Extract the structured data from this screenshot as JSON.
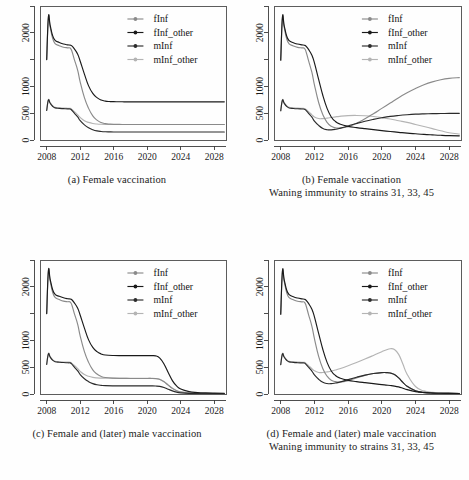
{
  "figure": {
    "panel_labels": [
      "(a)",
      "(b)",
      "(c)",
      "(d)"
    ]
  },
  "legend": {
    "position": "top-right",
    "entries": [
      {
        "label": "fInf",
        "color": "#8a8a8a"
      },
      {
        "label": "fInf_other",
        "color": "#1a1a1a"
      },
      {
        "label": "mInf",
        "color": "#2b2b2b"
      },
      {
        "label": "mInf_other",
        "color": "#b4b4b4"
      }
    ]
  },
  "axis": {
    "x_ticks": [
      2008,
      2012,
      2016,
      2020,
      2024,
      2028
    ],
    "x_tick_labels": [
      "2008",
      "2012",
      "2016",
      "2020",
      "2024",
      "2028"
    ],
    "y_ticks": [
      0,
      500,
      1000,
      1500,
      2000,
      2500
    ],
    "y_tick_labels": [
      "0",
      "500",
      "1000",
      "",
      "2000",
      ""
    ],
    "xlim": [
      2007.2,
      2029.4
    ],
    "ylim": [
      0,
      2500
    ]
  },
  "captions": {
    "a": [
      "(a) Female vaccination"
    ],
    "b": [
      "(b) Female vaccination",
      "Waning immunity to strains 31, 33, 45"
    ],
    "c": [
      "(c) Female and (later) male vaccination"
    ],
    "d": [
      "(d) Female and (later) male vaccination",
      "Waning immunity to strains 31, 33, 45"
    ]
  },
  "chart_data": [
    {
      "id": "a",
      "type": "line",
      "title": "(a) Female vaccination",
      "xlabel": "",
      "ylabel": "",
      "xlim": [
        2007.2,
        2029.4
      ],
      "ylim": [
        0,
        2500
      ],
      "grid": false,
      "legend_position": "top-right",
      "x": [
        2008.0,
        2008.2,
        2008.4,
        2008.7,
        2009.0,
        2009.5,
        2010.0,
        2010.5,
        2010.8,
        2011.0,
        2011.3,
        2011.7,
        2012.0,
        2012.5,
        2013.0,
        2013.5,
        2014.0,
        2014.5,
        2015.0,
        2015.5,
        2016.0,
        2017.0,
        2018.0,
        2020.0,
        2022.0,
        2024.0,
        2026.0,
        2028.0,
        2029.2
      ],
      "series": [
        {
          "name": "fInf_other",
          "color": "#1a1a1a",
          "values": [
            1500,
            2290,
            2150,
            1950,
            1860,
            1820,
            1790,
            1775,
            1770,
            1755,
            1700,
            1600,
            1470,
            1230,
            1010,
            870,
            790,
            745,
            725,
            718,
            715,
            713,
            712,
            712,
            712,
            712,
            712,
            712,
            712
          ]
        },
        {
          "name": "fInf",
          "color": "#8a8a8a",
          "values": [
            1500,
            2280,
            2120,
            1900,
            1800,
            1760,
            1730,
            1720,
            1715,
            1660,
            1500,
            1300,
            1080,
            790,
            590,
            450,
            370,
            325,
            305,
            296,
            292,
            290,
            289,
            289,
            289,
            289,
            289,
            289,
            289
          ]
        },
        {
          "name": "mInf_other",
          "color": "#b4b4b4",
          "values": [
            550,
            750,
            700,
            640,
            610,
            600,
            596,
            592,
            590,
            570,
            530,
            470,
            420,
            360,
            328,
            308,
            298,
            293,
            291,
            290,
            290,
            290,
            290,
            290,
            290,
            290,
            290,
            290,
            290
          ]
        },
        {
          "name": "mInf",
          "color": "#2b2b2b",
          "values": [
            550,
            745,
            690,
            630,
            600,
            590,
            585,
            580,
            578,
            555,
            500,
            430,
            360,
            282,
            228,
            192,
            170,
            159,
            153,
            151,
            150,
            150,
            150,
            150,
            150,
            150,
            150,
            150,
            150
          ]
        }
      ]
    },
    {
      "id": "b",
      "type": "line",
      "title": "(b) Female vaccination / Waning immunity to strains 31, 33, 45",
      "xlabel": "",
      "ylabel": "",
      "xlim": [
        2007.2,
        2029.4
      ],
      "ylim": [
        0,
        2500
      ],
      "grid": false,
      "legend_position": "top-right",
      "x": [
        2008.0,
        2008.2,
        2008.4,
        2008.7,
        2009.0,
        2009.5,
        2010.0,
        2010.5,
        2010.8,
        2011.0,
        2011.3,
        2011.7,
        2012.0,
        2012.5,
        2013.0,
        2013.5,
        2014.0,
        2014.5,
        2015.0,
        2016.0,
        2017.0,
        2018.0,
        2019.0,
        2020.0,
        2021.0,
        2022.0,
        2023.0,
        2024.0,
        2025.0,
        2026.0,
        2027.0,
        2028.0,
        2029.2
      ],
      "series": [
        {
          "name": "fInf_other",
          "color": "#1a1a1a",
          "values": [
            1490,
            2290,
            2140,
            1940,
            1855,
            1815,
            1790,
            1775,
            1768,
            1750,
            1690,
            1580,
            1440,
            1130,
            830,
            590,
            430,
            345,
            300,
            255,
            232,
            212,
            193,
            175,
            158,
            143,
            128,
            116,
            105,
            96,
            88,
            82,
            78
          ]
        },
        {
          "name": "fInf",
          "color": "#8a8a8a",
          "values": [
            1490,
            2275,
            2110,
            1890,
            1795,
            1755,
            1728,
            1718,
            1712,
            1650,
            1480,
            1260,
            1030,
            700,
            470,
            330,
            255,
            228,
            222,
            248,
            310,
            395,
            490,
            590,
            690,
            790,
            880,
            960,
            1030,
            1085,
            1125,
            1150,
            1163
          ]
        },
        {
          "name": "mInf_other",
          "color": "#b4b4b4",
          "values": [
            545,
            748,
            698,
            638,
            610,
            600,
            595,
            590,
            588,
            568,
            528,
            470,
            430,
            400,
            400,
            408,
            420,
            432,
            442,
            455,
            458,
            452,
            438,
            418,
            392,
            360,
            328,
            290,
            252,
            212,
            172,
            135,
            112
          ]
        },
        {
          "name": "mInf",
          "color": "#2b2b2b",
          "values": [
            545,
            742,
            688,
            628,
            598,
            588,
            582,
            578,
            575,
            552,
            498,
            425,
            352,
            272,
            215,
            192,
            190,
            200,
            218,
            262,
            308,
            350,
            385,
            415,
            440,
            458,
            472,
            482,
            488,
            492,
            494,
            496,
            497
          ]
        }
      ]
    },
    {
      "id": "c",
      "type": "line",
      "title": "(c) Female and (later) male vaccination",
      "xlabel": "",
      "ylabel": "",
      "xlim": [
        2007.2,
        2029.4
      ],
      "ylim": [
        0,
        2500
      ],
      "grid": false,
      "legend_position": "top-right",
      "x": [
        2008.0,
        2008.2,
        2008.4,
        2008.7,
        2009.0,
        2009.5,
        2010.0,
        2010.5,
        2010.8,
        2011.0,
        2011.3,
        2011.7,
        2012.0,
        2012.5,
        2013.0,
        2013.5,
        2014.0,
        2014.5,
        2015.0,
        2016.0,
        2017.0,
        2018.0,
        2019.0,
        2020.0,
        2020.5,
        2021.0,
        2021.5,
        2022.0,
        2022.5,
        2023.0,
        2023.5,
        2024.0,
        2025.0,
        2026.0,
        2027.0,
        2028.0,
        2029.2
      ],
      "series": [
        {
          "name": "fInf_other",
          "color": "#1a1a1a",
          "values": [
            1500,
            2295,
            2150,
            1950,
            1860,
            1822,
            1795,
            1778,
            1772,
            1758,
            1700,
            1600,
            1470,
            1230,
            1010,
            870,
            790,
            748,
            728,
            718,
            716,
            715,
            715,
            716,
            716,
            712,
            670,
            560,
            400,
            250,
            150,
            92,
            45,
            28,
            20,
            16,
            14
          ]
        },
        {
          "name": "fInf",
          "color": "#8a8a8a",
          "values": [
            1500,
            2282,
            2122,
            1902,
            1802,
            1762,
            1732,
            1722,
            1716,
            1660,
            1500,
            1300,
            1080,
            790,
            590,
            450,
            372,
            328,
            308,
            296,
            292,
            290,
            290,
            290,
            290,
            286,
            270,
            228,
            165,
            105,
            62,
            38,
            18,
            11,
            8,
            6,
            5
          ]
        },
        {
          "name": "mInf_other",
          "color": "#b4b4b4",
          "values": [
            552,
            752,
            702,
            642,
            612,
            602,
            598,
            594,
            592,
            572,
            532,
            472,
            422,
            362,
            330,
            310,
            300,
            296,
            294,
            293,
            293,
            293,
            293,
            293,
            293,
            290,
            275,
            232,
            168,
            108,
            64,
            40,
            19,
            12,
            9,
            7,
            6
          ]
        },
        {
          "name": "mInf",
          "color": "#2b2b2b",
          "values": [
            552,
            748,
            692,
            632,
            602,
            592,
            587,
            582,
            580,
            557,
            502,
            432,
            362,
            284,
            230,
            194,
            172,
            161,
            155,
            152,
            151,
            151,
            151,
            151,
            151,
            149,
            142,
            122,
            90,
            58,
            35,
            22,
            11,
            7,
            5,
            4,
            4
          ]
        }
      ]
    },
    {
      "id": "d",
      "type": "line",
      "title": "(d) Female and (later) male vaccination / Waning immunity to strains 31, 33, 45",
      "xlabel": "",
      "ylabel": "",
      "xlim": [
        2007.2,
        2029.4
      ],
      "ylim": [
        0,
        2500
      ],
      "grid": false,
      "legend_position": "top-right",
      "x": [
        2008.0,
        2008.2,
        2008.4,
        2008.7,
        2009.0,
        2009.5,
        2010.0,
        2010.5,
        2010.8,
        2011.0,
        2011.3,
        2011.7,
        2012.0,
        2012.5,
        2013.0,
        2013.5,
        2014.0,
        2014.5,
        2015.0,
        2016.0,
        2017.0,
        2018.0,
        2019.0,
        2020.0,
        2020.5,
        2021.0,
        2021.5,
        2022.0,
        2022.5,
        2023.0,
        2024.0,
        2025.0,
        2026.0,
        2027.0,
        2028.0,
        2029.2
      ],
      "series": [
        {
          "name": "fInf_other",
          "color": "#1a1a1a",
          "values": [
            1490,
            2290,
            2140,
            1940,
            1855,
            1815,
            1790,
            1775,
            1768,
            1750,
            1690,
            1580,
            1440,
            1130,
            830,
            590,
            430,
            345,
            300,
            255,
            232,
            212,
            193,
            175,
            166,
            158,
            148,
            132,
            108,
            82,
            45,
            26,
            17,
            13,
            11,
            10
          ]
        },
        {
          "name": "fInf",
          "color": "#8a8a8a",
          "values": [
            1490,
            2278,
            2112,
            1892,
            1798,
            1758,
            1730,
            1720,
            1714,
            1652,
            1482,
            1262,
            1032,
            702,
            472,
            332,
            258,
            230,
            224,
            250,
            300,
            348,
            382,
            400,
            400,
            392,
            362,
            300,
            218,
            145,
            62,
            30,
            18,
            13,
            11,
            10
          ]
        },
        {
          "name": "mInf_other",
          "color": "#b4b4b4",
          "values": [
            548,
            752,
            700,
            640,
            612,
            602,
            597,
            592,
            590,
            570,
            530,
            472,
            432,
            402,
            402,
            412,
            428,
            448,
            472,
            528,
            588,
            652,
            720,
            790,
            822,
            845,
            830,
            740,
            560,
            370,
            140,
            58,
            30,
            20,
            15,
            13
          ]
        },
        {
          "name": "mInf",
          "color": "#2b2b2b",
          "values": [
            548,
            745,
            690,
            630,
            600,
            590,
            584,
            580,
            577,
            554,
            500,
            428,
            355,
            275,
            218,
            195,
            193,
            205,
            222,
            268,
            312,
            352,
            382,
            400,
            400,
            392,
            362,
            300,
            218,
            145,
            62,
            30,
            18,
            13,
            11,
            10
          ]
        }
      ]
    }
  ]
}
